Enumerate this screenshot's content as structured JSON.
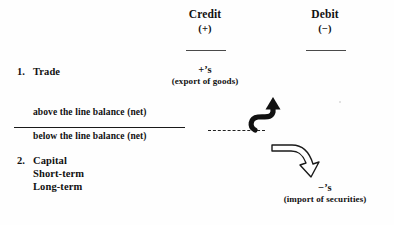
{
  "figure": {
    "type": "accounting-diagram",
    "columns": [
      {
        "name": "credit",
        "label": "Credit",
        "sign": "(+)"
      },
      {
        "name": "debit",
        "label": "Debit",
        "sign": "(−)"
      }
    ],
    "rows": [
      {
        "number": "1.",
        "label": "Trade",
        "credit_entry": "+’s",
        "credit_note": "(export of goods)"
      },
      {
        "number": "2.",
        "label": "Capital",
        "sublabels": [
          "Short-term",
          "Long-term"
        ],
        "debit_entry": "−’s",
        "debit_note": "(import of securities)"
      }
    ],
    "balance_lines": {
      "above": "above the line balance (net)",
      "below": "below the line balance (net)"
    },
    "annotations": {
      "up_arrow": "solid-curved-arrow-up-left",
      "down_arrow": "outline-curved-arrow-down-right",
      "dashed_connector": "dashed-line"
    }
  }
}
